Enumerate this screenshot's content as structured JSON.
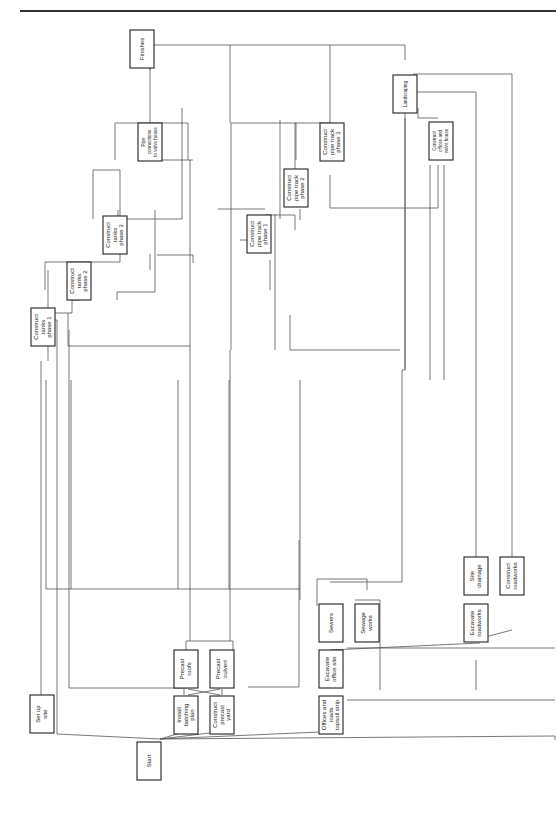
{
  "diagram": {
    "type": "precedence-network",
    "orientation": "rotated-90-ccw",
    "nodes": {
      "start": [
        "Start"
      ],
      "set_up_site": [
        "Set up",
        "site"
      ],
      "install_batching_plant": [
        "Install",
        "batching",
        "plan"
      ],
      "construct_precast_yard": [
        "Construct",
        "precast",
        "yard"
      ],
      "precast_roofs": [
        "Precast",
        "roofs"
      ],
      "precast_culvert": [
        "Precast",
        "culvert"
      ],
      "offices_roads_topsoil": [
        "Offices and",
        "roads",
        "topsoil strip"
      ],
      "excavate_office_site": [
        "Excavate",
        "office site"
      ],
      "sewers": [
        "Sewers"
      ],
      "sewage_works": [
        "Sewage",
        "works"
      ],
      "excavate_roadworks": [
        "Excavate",
        "roadworks"
      ],
      "site_drainage": [
        "Site",
        "drainage"
      ],
      "construct_roadworks": [
        "Construct",
        "roadworks"
      ],
      "construct_tanks_1": [
        "Construct",
        "tanks",
        "phase 1"
      ],
      "construct_tanks_2": [
        "Construct",
        "tanks",
        "phase 2"
      ],
      "construct_tanks_3": [
        "Construct",
        "tanks",
        "phase 3"
      ],
      "pipe_connections": [
        "Pipe",
        "connections",
        "to valve house"
      ],
      "construct_pipe_track_1": [
        "Construct",
        "pipe track",
        "phase 1"
      ],
      "construct_pipe_track_2": [
        "Construct",
        "pipe track",
        "phase 2"
      ],
      "construct_pipe_track_3": [
        "Construct",
        "pipe track",
        "phase 3"
      ],
      "construct_offices_valve_house": [
        "Construct",
        "offices and",
        "valve house"
      ],
      "landscaping": [
        "Landscaping"
      ],
      "finishes": [
        "Finishes"
      ]
    },
    "edges": [
      [
        "Start",
        "Set up site"
      ],
      [
        "Start",
        "Install batching plan"
      ],
      [
        "Start",
        "Construct precast yard"
      ],
      [
        "Start",
        "Offices and roads topsoil strip"
      ],
      [
        "Start",
        "Excavate roadworks"
      ],
      [
        "Install batching plan",
        "Precast roofs"
      ],
      [
        "Install batching plan",
        "Precast culvert"
      ],
      [
        "Construct precast yard",
        "Precast roofs"
      ],
      [
        "Construct precast yard",
        "Precast culvert"
      ],
      [
        "Offices and roads topsoil strip",
        "Excavate office site"
      ],
      [
        "Excavate office site",
        "Sewers"
      ],
      [
        "Excavate office site",
        "Sewage works"
      ],
      [
        "Excavate roadworks",
        "Site drainage"
      ],
      [
        "Excavate roadworks",
        "Construct roadworks"
      ],
      [
        "Set up site",
        "Construct tanks phase 1"
      ],
      [
        "Construct tanks phase 1",
        "Construct tanks phase 2"
      ],
      [
        "Construct tanks phase 2",
        "Construct tanks phase 3"
      ],
      [
        "Construct tanks phase 3",
        "Pipe connections to valve house"
      ],
      [
        "Construct pipe track phase 1",
        "Construct pipe track phase 2"
      ],
      [
        "Construct pipe track phase 2",
        "Construct pipe track phase 3"
      ],
      [
        "Construct pipe track phase 3",
        "Finishes"
      ],
      [
        "Pipe connections to valve house",
        "Finishes"
      ],
      [
        "Construct offices and valve house",
        "Landscaping"
      ],
      [
        "Landscaping",
        "Finishes"
      ]
    ]
  }
}
